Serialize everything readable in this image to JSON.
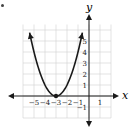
{
  "chart_data": {
    "type": "line",
    "title": "",
    "xlabel": "x",
    "ylabel": "y",
    "function": "y = (x + 3)^2",
    "vertex": [
      -3,
      0
    ],
    "x_ticks": [
      -5,
      -4,
      -3,
      -2,
      -1,
      1
    ],
    "x_tick_labels": [
      "−5",
      "−4",
      "−3",
      "−2",
      "−1",
      "1"
    ],
    "y_ticks": [
      -1,
      1,
      2,
      3,
      4,
      5
    ],
    "y_tick_labels": [
      "−1",
      "1",
      "2",
      "3",
      "4",
      "5"
    ],
    "xlim": [
      -6,
      2
    ],
    "ylim": [
      -2,
      6
    ],
    "grid": true,
    "series": [
      {
        "name": "parabola",
        "x": [
          -5.4,
          -5,
          -4.5,
          -4,
          -3.5,
          -3,
          -2.5,
          -2,
          -1.5,
          -1,
          -0.6
        ],
        "y": [
          5.76,
          4,
          2.25,
          1,
          0.25,
          0,
          0.25,
          1,
          2.25,
          4,
          5.76
        ]
      }
    ],
    "points": [
      {
        "x": -3,
        "y": 0
      }
    ],
    "colors": {
      "curve": "#1a1a1a",
      "grid": "#d0d0d0",
      "axis": "#1a1a1a"
    }
  }
}
